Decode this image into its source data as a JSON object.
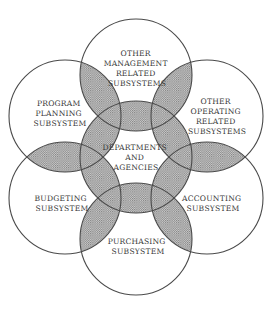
{
  "diagram": {
    "type": "overlapping-circles",
    "center": {
      "id": "center",
      "lines": [
        "DEPARTMENTS",
        "AND",
        "AGENCIES"
      ]
    },
    "satellites": [
      {
        "id": "top",
        "lines": [
          "OTHER",
          "MANAGEMENT",
          "RELATED",
          "SUBSYSTEMS"
        ]
      },
      {
        "id": "upper-right",
        "lines": [
          "OTHER",
          "OPERATING",
          "RELATED",
          "SUBSYSTEMS"
        ]
      },
      {
        "id": "lower-right",
        "lines": [
          "ACCOUNTING",
          "SUBSYSTEM"
        ]
      },
      {
        "id": "bottom",
        "lines": [
          "PURCHASING",
          "SUBSYSTEM"
        ]
      },
      {
        "id": "lower-left",
        "lines": [
          "BUDGETING",
          "SUBSYSTEM"
        ]
      },
      {
        "id": "upper-left",
        "lines": [
          "PROGRAM",
          "PLANNING",
          "SUBSYSTEM"
        ]
      }
    ],
    "colors": {
      "stroke": "#4a4a4a",
      "overlap_fill": "#bdbdbd",
      "text": "#3a3a3a",
      "background": "#ffffff"
    }
  }
}
